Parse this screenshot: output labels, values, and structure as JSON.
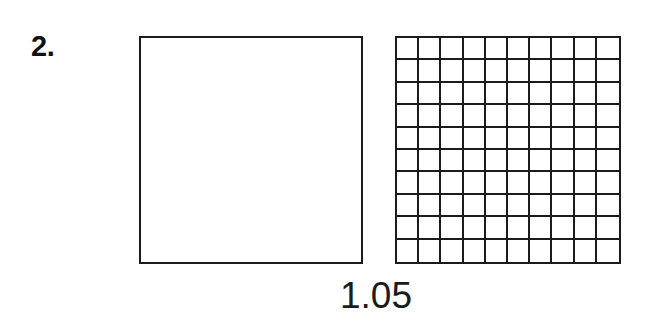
{
  "page": {
    "background_color": "#ffffff",
    "ink_color": "#1b1b1b",
    "width": 646,
    "height": 325
  },
  "problem": {
    "number_label": "2.",
    "value_caption": "1.05"
  },
  "figures": {
    "unit_square": {
      "name": "blank-unit-square",
      "shaded_cells": 0,
      "total_cells": 1,
      "label": ""
    },
    "hundredths_grid": {
      "name": "hundredths-grid",
      "rows": 10,
      "columns": 10,
      "total_cells": 100,
      "shaded_cells": 0,
      "label": ""
    }
  },
  "chart_data": {
    "type": "table",
    "title": "1.05",
    "categories": [
      "whole unit square",
      "hundredths grid"
    ],
    "values": [
      1,
      100
    ],
    "xlabel": "",
    "ylabel": "",
    "annotations": [
      "2.",
      "1.05"
    ]
  }
}
